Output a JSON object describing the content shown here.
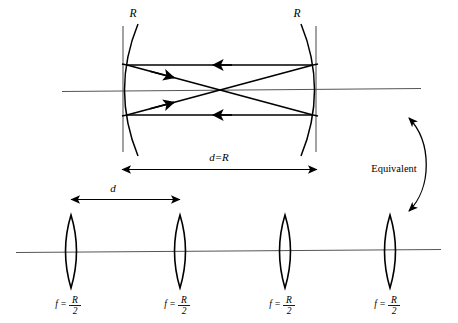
{
  "figure": {
    "type": "optical-diagram",
    "title_text": "",
    "colors": {
      "ink": "#000000",
      "axis": "#555555",
      "background": "#ffffff"
    },
    "upper_section": {
      "description": "Confocal resonator cavity formed by two concave spherical mirrors",
      "mirror_left": {
        "radius_label": "R",
        "label_x": 133,
        "label_y": 16,
        "vertex_x": 123,
        "axis_y": 90
      },
      "mirror_right": {
        "radius_label": "R",
        "label_x": 297,
        "label_y": 16,
        "vertex_x": 316,
        "axis_y": 90
      },
      "dimension": {
        "label": "d=R",
        "label_x": 219,
        "label_y": 157,
        "arrow_y": 169,
        "arrow_x1": 122,
        "arrow_x2": 317
      },
      "ray_arrow_count": 4
    },
    "equivalent_marker": {
      "label": "Equivalent",
      "label_x": 394,
      "label_y": 168,
      "arrow_top_x": 406,
      "arrow_top_y": 117,
      "arrow_bottom_x": 406,
      "arrow_bottom_y": 212
    },
    "lower_section": {
      "description": "Equivalent periodic lens waveguide of identical converging lenses",
      "axis_y": 251,
      "axis_x1": 16,
      "axis_x2": 441,
      "spacing": {
        "label": "d",
        "label_x": 113,
        "label_y": 188,
        "arrow_y": 199,
        "arrow_x1": 71,
        "arrow_x2": 180
      },
      "lenses": [
        {
          "index": 1,
          "center_x": 71,
          "focal_label_prefix": "f =",
          "focal_numerator": "R",
          "focal_denominator": "2"
        },
        {
          "index": 2,
          "center_x": 180,
          "focal_label_prefix": "f =",
          "focal_numerator": "R",
          "focal_denominator": "2"
        },
        {
          "index": 3,
          "center_x": 285,
          "focal_label_prefix": "f =",
          "focal_numerator": "R",
          "focal_denominator": "2"
        },
        {
          "index": 4,
          "center_x": 390,
          "focal_label_prefix": "f =",
          "focal_numerator": "R",
          "focal_denominator": "2"
        }
      ]
    }
  }
}
